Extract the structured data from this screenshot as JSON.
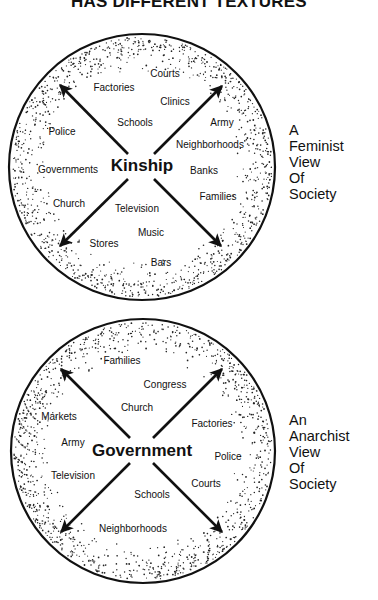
{
  "title": "HAS DIFFERENT TEXTURES",
  "diagrams": [
    {
      "center_label": "Kinship",
      "caption": [
        "A",
        "Feminist",
        "View",
        "Of",
        "Society"
      ],
      "labels": [
        {
          "text": "Courts",
          "x": 165,
          "y": 73
        },
        {
          "text": "Factories",
          "x": 114,
          "y": 87
        },
        {
          "text": "Clinics",
          "x": 175,
          "y": 101
        },
        {
          "text": "Schools",
          "x": 135,
          "y": 122
        },
        {
          "text": "Army",
          "x": 222,
          "y": 122
        },
        {
          "text": "Police",
          "x": 62,
          "y": 131
        },
        {
          "text": "Neighborhoods",
          "x": 210,
          "y": 144
        },
        {
          "text": "Governments",
          "x": 68,
          "y": 169
        },
        {
          "text": "Banks",
          "x": 204,
          "y": 170
        },
        {
          "text": "Families",
          "x": 218,
          "y": 196
        },
        {
          "text": "Church",
          "x": 69,
          "y": 203
        },
        {
          "text": "Television",
          "x": 137,
          "y": 208
        },
        {
          "text": "Music",
          "x": 151,
          "y": 232
        },
        {
          "text": "Stores",
          "x": 104,
          "y": 243
        },
        {
          "text": "Bars",
          "x": 161,
          "y": 262
        }
      ]
    },
    {
      "center_label": "Government",
      "caption": [
        "An",
        "Anarchist",
        "View",
        "Of",
        "Society"
      ],
      "labels": [
        {
          "text": "Families",
          "x": 122,
          "y": 360
        },
        {
          "text": "Congress",
          "x": 165,
          "y": 384
        },
        {
          "text": "Church",
          "x": 137,
          "y": 407
        },
        {
          "text": "Markets",
          "x": 59,
          "y": 416
        },
        {
          "text": "Factories",
          "x": 212,
          "y": 423
        },
        {
          "text": "Army",
          "x": 73,
          "y": 442
        },
        {
          "text": "Police",
          "x": 228,
          "y": 456
        },
        {
          "text": "Television",
          "x": 73,
          "y": 475
        },
        {
          "text": "Courts",
          "x": 206,
          "y": 483
        },
        {
          "text": "Schools",
          "x": 152,
          "y": 494
        },
        {
          "text": "Neighborhoods",
          "x": 133,
          "y": 528
        }
      ]
    }
  ]
}
